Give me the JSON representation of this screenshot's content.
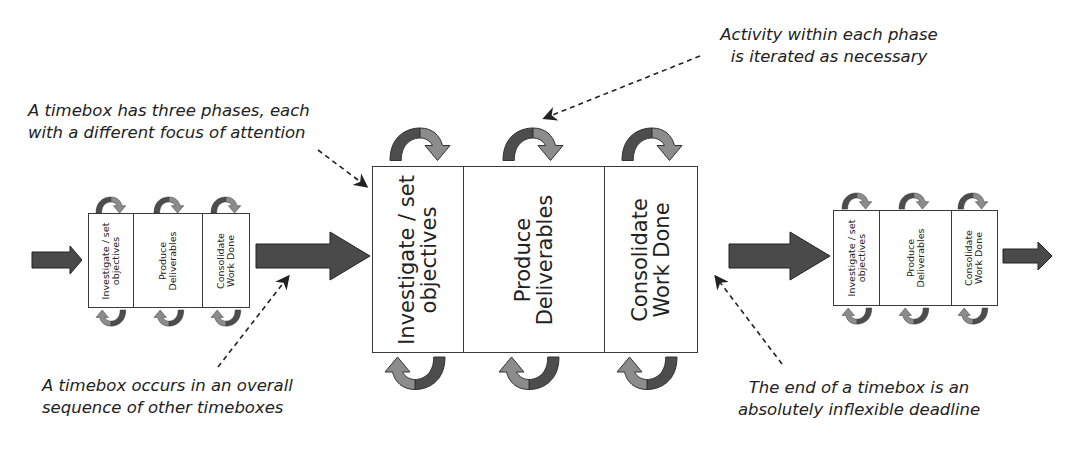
{
  "diagram": {
    "type": "timebox sequence",
    "colors": {
      "flow_arrow": "#4a4a4a",
      "iteration_arrow_dark": "#4d4d4d",
      "iteration_arrow_light": "#8c8c8c",
      "box_border": "#3a3a3a",
      "text": "#222222"
    },
    "timeboxes": [
      {
        "id": "previous",
        "size": "small",
        "phases": [
          {
            "label": "Investigate / set\nobjectives"
          },
          {
            "label": "Produce\nDeliverables"
          },
          {
            "label": "Consolidate\nWork Done"
          }
        ]
      },
      {
        "id": "current",
        "size": "large",
        "phases": [
          {
            "label": "Investigate / set\nobjectives"
          },
          {
            "label": "Produce\nDeliverables"
          },
          {
            "label": "Consolidate\nWork Done"
          }
        ]
      },
      {
        "id": "next",
        "size": "small",
        "phases": [
          {
            "label": "Investigate / set\nobjectives"
          },
          {
            "label": "Produce\nDeliverables"
          },
          {
            "label": "Consolidate\nWork Done"
          }
        ]
      }
    ],
    "callouts": {
      "three_phases": "A timebox has three phases, each\nwith a different focus of attention",
      "iterated": "Activity within each phase\nis iterated as necessary",
      "sequence": "A timebox occurs in an overall\nsequence of other timeboxes",
      "deadline": "The end of a timebox is an\nabsolutely inflexible deadline"
    }
  }
}
